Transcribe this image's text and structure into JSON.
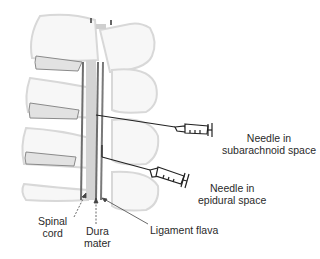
{
  "diagram": {
    "colors": {
      "bone_outline": "#d6d6d6",
      "bone_fill": "#f6f6f6",
      "disc_fill": "#e2e2e2",
      "disc_outline": "#8a8a8a",
      "cord": "#cfcfcf",
      "dura": "#6e6e6e",
      "ligament": "#7a7a7a",
      "needle": "#222222",
      "text": "#2a2a2a"
    },
    "labels": {
      "needle_subarachnoid": [
        "Needle in",
        "subarachnoid space"
      ],
      "needle_epidural": [
        "Needle in",
        "epidural space"
      ],
      "spinal_cord": [
        "Spinal",
        "cord"
      ],
      "dura_mater": [
        "Dura",
        "mater"
      ],
      "ligament_flava": "Ligament flava"
    }
  }
}
